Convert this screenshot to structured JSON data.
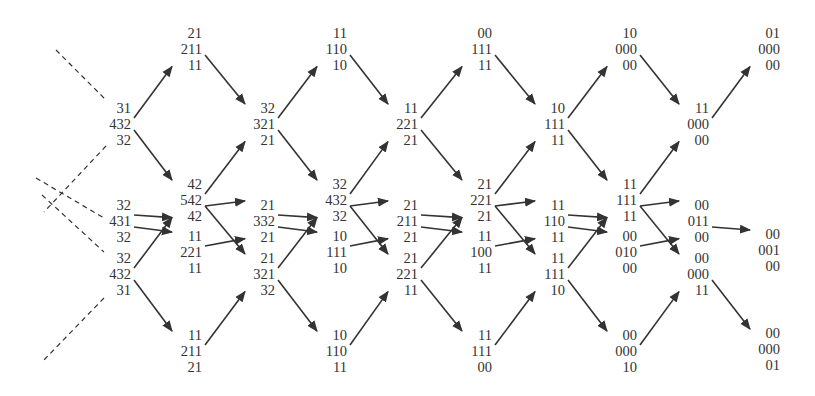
{
  "diagram": {
    "type": "trellis",
    "colors": {
      "text": "#333333",
      "edge": "#333333",
      "background": "#ffffff"
    },
    "line_height": 16,
    "nodes": [
      {
        "id": "n0a",
        "rx": 131,
        "y": 100,
        "lines": [
          "31",
          "432",
          "32"
        ]
      },
      {
        "id": "n0b",
        "rx": 131,
        "y": 197,
        "lines": [
          "32",
          "431",
          "32"
        ]
      },
      {
        "id": "n0c",
        "rx": 131,
        "y": 250,
        "lines": [
          "32",
          "432",
          "31"
        ]
      },
      {
        "id": "n1a",
        "rx": 202,
        "y": 25,
        "lines": [
          "21",
          "211",
          "11"
        ]
      },
      {
        "id": "n1b",
        "rx": 202,
        "y": 176,
        "lines": [
          "42",
          "542",
          "42"
        ]
      },
      {
        "id": "n1c",
        "rx": 202,
        "y": 228,
        "lines": [
          "11",
          "221",
          "11"
        ]
      },
      {
        "id": "n1d",
        "rx": 202,
        "y": 327,
        "lines": [
          "11",
          "211",
          "21"
        ]
      },
      {
        "id": "n2a",
        "rx": 275,
        "y": 100,
        "lines": [
          "32",
          "321",
          "21"
        ]
      },
      {
        "id": "n2b",
        "rx": 275,
        "y": 197,
        "lines": [
          "21",
          "332",
          "21"
        ]
      },
      {
        "id": "n2c",
        "rx": 275,
        "y": 250,
        "lines": [
          "21",
          "321",
          "32"
        ]
      },
      {
        "id": "n3a",
        "rx": 347,
        "y": 25,
        "lines": [
          "11",
          "110",
          "10"
        ]
      },
      {
        "id": "n3b",
        "rx": 347,
        "y": 176,
        "lines": [
          "32",
          "432",
          "32"
        ]
      },
      {
        "id": "n3c",
        "rx": 347,
        "y": 228,
        "lines": [
          "10",
          "111",
          "10"
        ]
      },
      {
        "id": "n3d",
        "rx": 347,
        "y": 327,
        "lines": [
          "10",
          "110",
          "11"
        ]
      },
      {
        "id": "n4a",
        "rx": 418,
        "y": 100,
        "lines": [
          "11",
          "221",
          "21"
        ]
      },
      {
        "id": "n4b",
        "rx": 418,
        "y": 197,
        "lines": [
          "21",
          "211",
          "21"
        ]
      },
      {
        "id": "n4c",
        "rx": 418,
        "y": 250,
        "lines": [
          "21",
          "221",
          "11"
        ]
      },
      {
        "id": "n5a",
        "rx": 492,
        "y": 25,
        "lines": [
          "00",
          "111",
          "11"
        ]
      },
      {
        "id": "n5b",
        "rx": 492,
        "y": 176,
        "lines": [
          "21",
          "221",
          "21"
        ]
      },
      {
        "id": "n5c",
        "rx": 492,
        "y": 228,
        "lines": [
          "11",
          "100",
          "11"
        ]
      },
      {
        "id": "n5d",
        "rx": 492,
        "y": 327,
        "lines": [
          "11",
          "111",
          "00"
        ]
      },
      {
        "id": "n6a",
        "rx": 565,
        "y": 100,
        "lines": [
          "10",
          "111",
          "11"
        ]
      },
      {
        "id": "n6b",
        "rx": 565,
        "y": 197,
        "lines": [
          "11",
          "110",
          "11"
        ]
      },
      {
        "id": "n6c",
        "rx": 565,
        "y": 250,
        "lines": [
          "11",
          "111",
          "10"
        ]
      },
      {
        "id": "n7a",
        "rx": 637,
        "y": 25,
        "lines": [
          "10",
          "000",
          "00"
        ]
      },
      {
        "id": "n7b",
        "rx": 637,
        "y": 176,
        "lines": [
          "11",
          "111",
          "11"
        ]
      },
      {
        "id": "n7c",
        "rx": 637,
        "y": 228,
        "lines": [
          "00",
          "010",
          "00"
        ]
      },
      {
        "id": "n7d",
        "rx": 637,
        "y": 327,
        "lines": [
          "00",
          "000",
          "10"
        ]
      },
      {
        "id": "n8a",
        "rx": 709,
        "y": 100,
        "lines": [
          "11",
          "000",
          "00"
        ]
      },
      {
        "id": "n8b",
        "rx": 709,
        "y": 197,
        "lines": [
          "00",
          "011",
          "00"
        ]
      },
      {
        "id": "n8c",
        "rx": 709,
        "y": 250,
        "lines": [
          "00",
          "000",
          "11"
        ]
      },
      {
        "id": "n9a",
        "rx": 780,
        "y": 25,
        "lines": [
          "01",
          "000",
          "00"
        ]
      },
      {
        "id": "n9b",
        "rx": 780,
        "y": 226,
        "lines": [
          "00",
          "001",
          "00"
        ]
      },
      {
        "id": "n9c",
        "rx": 780,
        "y": 325,
        "lines": [
          "00",
          "000",
          "01"
        ]
      }
    ],
    "edges": [
      [
        "n0a",
        "n1a"
      ],
      [
        "n0a",
        "n1b"
      ],
      [
        "n0b",
        "n1b"
      ],
      [
        "n0b",
        "n1c"
      ],
      [
        "n0c",
        "n1b"
      ],
      [
        "n0c",
        "n1d"
      ],
      [
        "n1a",
        "n2a"
      ],
      [
        "n1b",
        "n2a"
      ],
      [
        "n1b",
        "n2b"
      ],
      [
        "n1b",
        "n2c"
      ],
      [
        "n1c",
        "n2b"
      ],
      [
        "n1d",
        "n2c"
      ],
      [
        "n2a",
        "n3a"
      ],
      [
        "n2a",
        "n3b"
      ],
      [
        "n2b",
        "n3b"
      ],
      [
        "n2b",
        "n3c"
      ],
      [
        "n2c",
        "n3b"
      ],
      [
        "n2c",
        "n3d"
      ],
      [
        "n3a",
        "n4a"
      ],
      [
        "n3b",
        "n4a"
      ],
      [
        "n3b",
        "n4b"
      ],
      [
        "n3b",
        "n4c"
      ],
      [
        "n3c",
        "n4b"
      ],
      [
        "n3d",
        "n4c"
      ],
      [
        "n4a",
        "n5a"
      ],
      [
        "n4a",
        "n5b"
      ],
      [
        "n4b",
        "n5b"
      ],
      [
        "n4b",
        "n5c"
      ],
      [
        "n4c",
        "n5b"
      ],
      [
        "n4c",
        "n5d"
      ],
      [
        "n5a",
        "n6a"
      ],
      [
        "n5b",
        "n6a"
      ],
      [
        "n5b",
        "n6b"
      ],
      [
        "n5b",
        "n6c"
      ],
      [
        "n5c",
        "n6b"
      ],
      [
        "n5d",
        "n6c"
      ],
      [
        "n6a",
        "n7a"
      ],
      [
        "n6a",
        "n7b"
      ],
      [
        "n6b",
        "n7b"
      ],
      [
        "n6b",
        "n7c"
      ],
      [
        "n6c",
        "n7b"
      ],
      [
        "n6c",
        "n7d"
      ],
      [
        "n7a",
        "n8a"
      ],
      [
        "n7b",
        "n8a"
      ],
      [
        "n7b",
        "n8b"
      ],
      [
        "n7b",
        "n8c"
      ],
      [
        "n7c",
        "n8b"
      ],
      [
        "n7d",
        "n8c"
      ],
      [
        "n8a",
        "n9a"
      ],
      [
        "n8b",
        "n9b"
      ],
      [
        "n8c",
        "n9c"
      ]
    ],
    "dashed_lines": [
      [
        56,
        50,
        106,
        100
      ],
      [
        106,
        146,
        44,
        212
      ],
      [
        36,
        178,
        104,
        218
      ],
      [
        42,
        195,
        104,
        252
      ],
      [
        104,
        298,
        42,
        362
      ]
    ]
  }
}
